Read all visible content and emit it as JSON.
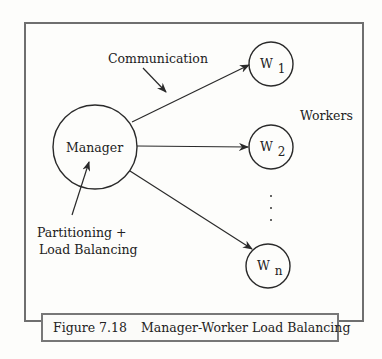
{
  "figure": {
    "number": "Figure 7.18",
    "title": "Manager-Worker Load Balancing"
  },
  "nodes": {
    "manager": {
      "label": "Manager"
    },
    "workers": [
      {
        "base": "W",
        "sub": "1"
      },
      {
        "base": "W",
        "sub": "2"
      },
      {
        "base": "W",
        "sub": "n"
      }
    ],
    "ellipsis": "· · ·"
  },
  "annotations": {
    "communication": "Communication",
    "workers_group": "Workers",
    "partitioning_line1": "Partitioning +",
    "partitioning_line2": "Load Balancing"
  },
  "colors": {
    "line": "#2a2a2a",
    "frame": "#6f6f6f",
    "background": "#fdfdfb"
  }
}
